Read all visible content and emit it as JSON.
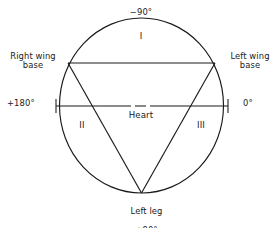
{
  "figure": {
    "type": "einthoven-triangle-axis-diagram",
    "stroke_color": "#1a1a1a",
    "background_color": "#ffffff"
  },
  "labels": {
    "top_degree": "−90°",
    "right_wing_base": "Right wing\nbase",
    "left_wing_base": "Left wing\nbase",
    "left_degree": "+180°",
    "right_degree": "0°",
    "center": "Heart",
    "quadrant_1": "I",
    "quadrant_2": "II",
    "quadrant_3": "III",
    "bottom_name": "Left leg",
    "bottom_degree": "+90°"
  },
  "chart_data": {
    "type": "scatter",
    "title": "",
    "xlabel": "",
    "ylabel": "",
    "annotations": [
      {
        "text": "−90°",
        "position": "top",
        "angle_deg": -90
      },
      {
        "text": "0°",
        "position": "right",
        "angle_deg": 0
      },
      {
        "text": "+90°",
        "position": "bottom",
        "angle_deg": 90
      },
      {
        "text": "+180°",
        "position": "left",
        "angle_deg": 180
      },
      {
        "text": "Heart",
        "position": "center"
      },
      {
        "text": "I",
        "position": "upper-middle"
      },
      {
        "text": "II",
        "position": "lower-left"
      },
      {
        "text": "III",
        "position": "lower-right"
      },
      {
        "text": "Right wing base",
        "position": "upper-left-vertex"
      },
      {
        "text": "Left wing base",
        "position": "upper-right-vertex"
      },
      {
        "text": "Left leg",
        "position": "bottom-vertex"
      }
    ],
    "geometry": {
      "circle_center": [
        141.5,
        105.5
      ],
      "circle_rx": 82,
      "circle_ry": 87.5,
      "triangle_vertices": [
        [
          68,
          63
        ],
        [
          215,
          63
        ],
        [
          141.5,
          193
        ]
      ],
      "horizontal_axis_y": 106,
      "axis_tick_left_x": 56,
      "axis_tick_right_x": 228
    },
    "legend_position": "none",
    "grid": false
  }
}
